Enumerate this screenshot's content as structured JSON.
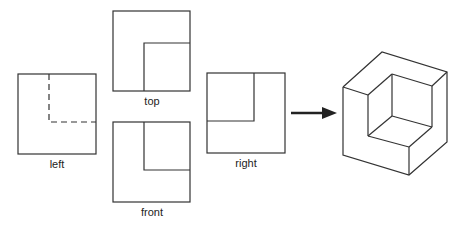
{
  "diagram": {
    "views": [
      {
        "id": "left",
        "label": "left",
        "label_pos": [
          57,
          158
        ]
      },
      {
        "id": "top",
        "label": "top",
        "label_pos": [
          152,
          95
        ]
      },
      {
        "id": "front",
        "label": "front",
        "label_pos": [
          152,
          206
        ]
      },
      {
        "id": "right",
        "label": "right",
        "label_pos": [
          246,
          157
        ]
      }
    ],
    "arrow": {
      "direction": "right",
      "meaning": "combine views into solid"
    },
    "result": "isometric-l-shaped-block",
    "colors": {
      "line": "#333333",
      "background": "#ffffff"
    }
  }
}
